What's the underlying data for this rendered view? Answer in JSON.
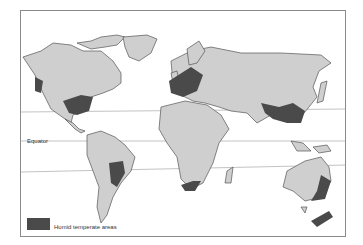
{
  "map": {
    "type": "world-map",
    "lines": [
      {
        "name": "Equator",
        "label": "Equator"
      }
    ],
    "legend": [
      {
        "label": "Humid temperate areas",
        "color": "#4a4a4a"
      }
    ],
    "colors": {
      "land": "#cfcfcf",
      "highlight": "#4a4a4a",
      "ocean": "#ffffff",
      "coast": "#555555"
    }
  }
}
